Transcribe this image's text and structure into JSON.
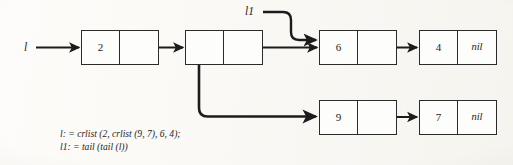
{
  "figure": {
    "kind": "linked-list-cons-cell-diagram",
    "background_color": "#fbfaf7",
    "ink_color": "#1c1c1c"
  },
  "pointers": [
    {
      "id": "l",
      "label": "l",
      "target": "node-2",
      "description": "horizontal arrow into first cons cell"
    },
    {
      "id": "l1",
      "label": "l1",
      "target": "node-6",
      "description": "S-curved arrow into the cons cell holding 6"
    }
  ],
  "nodes": [
    {
      "id": "node-2",
      "row": "top",
      "cells": [
        {
          "kind": "value",
          "text": "2"
        },
        {
          "kind": "pointer",
          "text": ""
        }
      ]
    },
    {
      "id": "node-sublist",
      "row": "top",
      "cells": [
        {
          "kind": "pointer",
          "text": ""
        },
        {
          "kind": "pointer",
          "text": ""
        }
      ]
    },
    {
      "id": "node-6",
      "row": "top",
      "cells": [
        {
          "kind": "value",
          "text": "6"
        },
        {
          "kind": "pointer",
          "text": ""
        }
      ]
    },
    {
      "id": "node-4",
      "row": "top",
      "cells": [
        {
          "kind": "value",
          "text": "4"
        },
        {
          "kind": "nil",
          "text": "nil"
        }
      ]
    },
    {
      "id": "node-9",
      "row": "bottom",
      "cells": [
        {
          "kind": "value",
          "text": "9"
        },
        {
          "kind": "pointer",
          "text": ""
        }
      ]
    },
    {
      "id": "node-7",
      "row": "bottom",
      "cells": [
        {
          "kind": "value",
          "text": "7"
        },
        {
          "kind": "nil",
          "text": "nil"
        }
      ]
    }
  ],
  "caption": {
    "line1": "l: = crlist (2, crlist (9, 7), 6, 4);",
    "line2": "l1: = tail (tail (l))",
    "line1_parts": {
      "var": "l",
      "assign": ": = ",
      "fn_outer": "crlist",
      "args_a": " (2, ",
      "fn_inner": "crlist",
      "args_b": " (9, 7), 6, 4);"
    },
    "line2_parts": {
      "var": "l1",
      "assign": ": = ",
      "fn_outer": "tail",
      "open": " (",
      "fn_inner": "tail",
      "inner_arg": " (",
      "var_ref": "l",
      "close": "))"
    }
  }
}
